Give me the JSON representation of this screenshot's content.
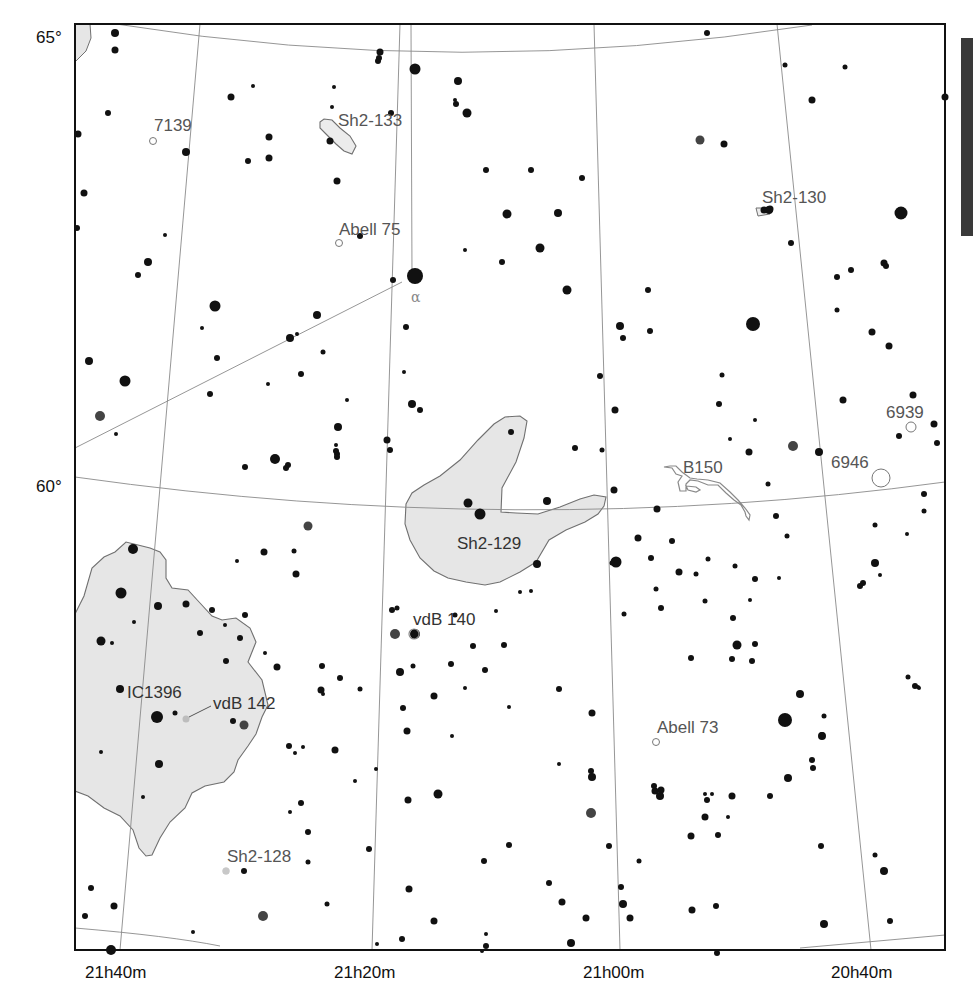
{
  "chart_data": {
    "type": "star_map",
    "title": "",
    "dec_labels": [
      {
        "text": "65°",
        "x": 38,
        "y": 30
      },
      {
        "text": "60°",
        "x": 38,
        "y": 492
      }
    ],
    "ra_labels": [
      {
        "text": "21h40m",
        "x": 118,
        "y": 978
      },
      {
        "text": "21h20m",
        "x": 372,
        "y": 978
      },
      {
        "text": "21h00m",
        "x": 622,
        "y": 978
      },
      {
        "text": "20h40m",
        "x": 867,
        "y": 978
      }
    ],
    "objects": [
      {
        "name": "7139",
        "type": "planetary-nebula",
        "label_x": 155,
        "label_y": 133,
        "mx": 153,
        "my": 141,
        "r": 3.5
      },
      {
        "name": "Sh2-133",
        "type": "emission-nebula",
        "label_x": 338,
        "label_y": 128
      },
      {
        "name": "Abell 75",
        "type": "planetary-nebula",
        "label_x": 340,
        "label_y": 235,
        "mx": 339,
        "my": 243,
        "r": 3.5
      },
      {
        "name": "Sh2-130",
        "type": "emission-nebula",
        "label_x": 762,
        "label_y": 203
      },
      {
        "name": "6939",
        "type": "open-cluster",
        "label_x": 887,
        "label_y": 418,
        "mx": 911,
        "my": 427,
        "r": 5
      },
      {
        "name": "6946",
        "type": "galaxy",
        "label_x": 831,
        "label_y": 468,
        "mx": 881,
        "my": 478,
        "r": 9
      },
      {
        "name": "B150",
        "type": "dark-nebula",
        "label_x": 683,
        "label_y": 473
      },
      {
        "name": "Sh2-129",
        "type": "emission-nebula",
        "label_x": 457,
        "label_y": 550
      },
      {
        "name": "vdB 140",
        "type": "reflection-nebula",
        "label_x": 414,
        "label_y": 625
      },
      {
        "name": "IC1396",
        "type": "emission-nebula",
        "label_x": 127,
        "label_y": 698
      },
      {
        "name": "vdB 142",
        "type": "reflection-nebula",
        "label_x": 213,
        "label_y": 710
      },
      {
        "name": "Abell 73",
        "type": "planetary-nebula",
        "label_x": 657,
        "label_y": 733,
        "mx": 656,
        "my": 742,
        "r": 3.5
      },
      {
        "name": "Sh2-128",
        "type": "emission-nebula",
        "label_x": 227,
        "label_y": 863,
        "mx": 226,
        "my": 871,
        "r": 3.5
      }
    ],
    "star_labels": [
      {
        "text": "α",
        "x": 411,
        "y": 302
      }
    ],
    "stars": [
      [
        115,
        33,
        4
      ],
      [
        115,
        50,
        3.5
      ],
      [
        108,
        113,
        3
      ],
      [
        78,
        134,
        3.5
      ],
      [
        84,
        193,
        3.5
      ],
      [
        77,
        228,
        3
      ],
      [
        186,
        152,
        4
      ],
      [
        148,
        262,
        4
      ],
      [
        215,
        306,
        5.5
      ],
      [
        125,
        381,
        5.5
      ],
      [
        100,
        416,
        5
      ],
      [
        89,
        361,
        4
      ],
      [
        116,
        434,
        2
      ],
      [
        165,
        235,
        2
      ],
      [
        138,
        275,
        3
      ],
      [
        202,
        328,
        2
      ],
      [
        217,
        358,
        3
      ],
      [
        231,
        97,
        3.5
      ],
      [
        253,
        86,
        2
      ],
      [
        269,
        137,
        3.5
      ],
      [
        248,
        161,
        3
      ],
      [
        269,
        158,
        3.5
      ],
      [
        210,
        394,
        3
      ],
      [
        380,
        52,
        3.5
      ],
      [
        379,
        58,
        3
      ],
      [
        378,
        61,
        3
      ],
      [
        334,
        87,
        2
      ],
      [
        332,
        107,
        2
      ],
      [
        391,
        113,
        3
      ],
      [
        330,
        141,
        3.5
      ],
      [
        337,
        181,
        3.5
      ],
      [
        360,
        236,
        3
      ],
      [
        415,
        69,
        5.5
      ],
      [
        458,
        81,
        4
      ],
      [
        455,
        100,
        2
      ],
      [
        456,
        104,
        3
      ],
      [
        467,
        113,
        4.5
      ],
      [
        415,
        276,
        8
      ],
      [
        393,
        280,
        3
      ],
      [
        486,
        170,
        3
      ],
      [
        531,
        170,
        3
      ],
      [
        582,
        178,
        3
      ],
      [
        507,
        214,
        4.5
      ],
      [
        558,
        213,
        4
      ],
      [
        540,
        248,
        4.5
      ],
      [
        465,
        250,
        2
      ],
      [
        502,
        262,
        3
      ],
      [
        567,
        290,
        4.5
      ],
      [
        620,
        326,
        4
      ],
      [
        648,
        290,
        3
      ],
      [
        650,
        331,
        3
      ],
      [
        707,
        33,
        3
      ],
      [
        785,
        65,
        2.5
      ],
      [
        812,
        100,
        3.5
      ],
      [
        700,
        140,
        4.5
      ],
      [
        724,
        144,
        3.5
      ],
      [
        845,
        67,
        2.5
      ],
      [
        791,
        243,
        3
      ],
      [
        753,
        324,
        7
      ],
      [
        769,
        210,
        4
      ],
      [
        945,
        97,
        3.5
      ],
      [
        901,
        213,
        6.5
      ],
      [
        884,
        263,
        3.5
      ],
      [
        886,
        266,
        3
      ],
      [
        851,
        270,
        3
      ],
      [
        837,
        277,
        3
      ],
      [
        837,
        310,
        2.5
      ],
      [
        872,
        332,
        3.5
      ],
      [
        793,
        446,
        5
      ],
      [
        819,
        452,
        4
      ],
      [
        843,
        400,
        3.5
      ],
      [
        913,
        395,
        3.5
      ],
      [
        889,
        346,
        3.5
      ],
      [
        899,
        436,
        3
      ],
      [
        937,
        443,
        3
      ],
      [
        934,
        424,
        3.5
      ],
      [
        924,
        494,
        3
      ],
      [
        924,
        511,
        2.5
      ],
      [
        907,
        534,
        2
      ],
      [
        875,
        563,
        4
      ],
      [
        863,
        583,
        3
      ],
      [
        880,
        575,
        2
      ],
      [
        317,
        315,
        4
      ],
      [
        297,
        334,
        2
      ],
      [
        290,
        338,
        4
      ],
      [
        268,
        384,
        2
      ],
      [
        323,
        352,
        2.5
      ],
      [
        347,
        400,
        2
      ],
      [
        301,
        374,
        3
      ],
      [
        288,
        465,
        3
      ],
      [
        245,
        467,
        3
      ],
      [
        275,
        459,
        5
      ],
      [
        286,
        468,
        3
      ],
      [
        406,
        327,
        3
      ],
      [
        412,
        404,
        4
      ],
      [
        387,
        440,
        3.5
      ],
      [
        390,
        450,
        3
      ],
      [
        404,
        372,
        2
      ],
      [
        338,
        427,
        4
      ],
      [
        336,
        451,
        3
      ],
      [
        337,
        454,
        3
      ],
      [
        337,
        457,
        3
      ],
      [
        336,
        445,
        2
      ],
      [
        468,
        503,
        4.5
      ],
      [
        480,
        514,
        5.5
      ],
      [
        547,
        501,
        4
      ],
      [
        537,
        564,
        4
      ],
      [
        511,
        432,
        3
      ],
      [
        420,
        410,
        3
      ],
      [
        575,
        448,
        3
      ],
      [
        623,
        338,
        3
      ],
      [
        600,
        376,
        3
      ],
      [
        615,
        410,
        3.5
      ],
      [
        602,
        450,
        2.5
      ],
      [
        614,
        490,
        3.5
      ],
      [
        616,
        562,
        5.5
      ],
      [
        657,
        509,
        3.5
      ],
      [
        719,
        404,
        3
      ],
      [
        722,
        375,
        2.5
      ],
      [
        768,
        484,
        2.5
      ],
      [
        776,
        516,
        3
      ],
      [
        787,
        536,
        2.5
      ],
      [
        749,
        452,
        3.5
      ],
      [
        730,
        439,
        2
      ],
      [
        755,
        420,
        2
      ],
      [
        679,
        572,
        3.5
      ],
      [
        656,
        589,
        2.5
      ],
      [
        705,
        601,
        2.5
      ],
      [
        733,
        618,
        3
      ],
      [
        750,
        600,
        2
      ],
      [
        779,
        578,
        2
      ],
      [
        691,
        658,
        3
      ],
      [
        732,
        659,
        3
      ],
      [
        737,
        645,
        4.5
      ],
      [
        755,
        644,
        3
      ],
      [
        752,
        661,
        3
      ],
      [
        785,
        720,
        7
      ],
      [
        822,
        736,
        4
      ],
      [
        824,
        716,
        2.5
      ],
      [
        822,
        735,
        3
      ],
      [
        812,
        760,
        3
      ],
      [
        800,
        694,
        4
      ],
      [
        788,
        778,
        4
      ],
      [
        821,
        846,
        3
      ],
      [
        884,
        871,
        4
      ],
      [
        875,
        855,
        2.5
      ],
      [
        824,
        924,
        4
      ],
      [
        890,
        921,
        3
      ],
      [
        915,
        686,
        3
      ],
      [
        918,
        687,
        2
      ],
      [
        908,
        677,
        2.5
      ],
      [
        919,
        688,
        2
      ],
      [
        860,
        586,
        3
      ],
      [
        875,
        525,
        2.5
      ],
      [
        133,
        549,
        5
      ],
      [
        121,
        593,
        5.5
      ],
      [
        134,
        622,
        2
      ],
      [
        101,
        641,
        4.5
      ],
      [
        112,
        643,
        2
      ],
      [
        158,
        606,
        4
      ],
      [
        186,
        604,
        3.5
      ],
      [
        212,
        610,
        3
      ],
      [
        240,
        638,
        3
      ],
      [
        245,
        615,
        3
      ],
      [
        264,
        552,
        3.5
      ],
      [
        237,
        561,
        2
      ],
      [
        294,
        551,
        2.5
      ],
      [
        296,
        574,
        3.5
      ],
      [
        308,
        526,
        4.5
      ],
      [
        225,
        625,
        2
      ],
      [
        200,
        633,
        3
      ],
      [
        226,
        661,
        3
      ],
      [
        120,
        689,
        4
      ],
      [
        157,
        717,
        6
      ],
      [
        175,
        713,
        2.5
      ],
      [
        233,
        721,
        3
      ],
      [
        244,
        725,
        4.5
      ],
      [
        101,
        752,
        2
      ],
      [
        159,
        764,
        4
      ],
      [
        143,
        797,
        2
      ],
      [
        265,
        653,
        2
      ],
      [
        277,
        667,
        3.5
      ],
      [
        289,
        746,
        3
      ],
      [
        303,
        747,
        2
      ],
      [
        322,
        666,
        3
      ],
      [
        340,
        678,
        3
      ],
      [
        290,
        812,
        2
      ],
      [
        295,
        753,
        2
      ],
      [
        244,
        871,
        3
      ],
      [
        263,
        916,
        5
      ],
      [
        91,
        888,
        3
      ],
      [
        114,
        906,
        3.5
      ],
      [
        85,
        916,
        3
      ],
      [
        193,
        932,
        2
      ],
      [
        321,
        690,
        3.5
      ],
      [
        323,
        694,
        2
      ],
      [
        111,
        950,
        5
      ],
      [
        395,
        634,
        5
      ],
      [
        415,
        634,
        5
      ],
      [
        392,
        610,
        3
      ],
      [
        397,
        608,
        2.5
      ],
      [
        455,
        615,
        2.5
      ],
      [
        496,
        611,
        2
      ],
      [
        400,
        672,
        4
      ],
      [
        413,
        666,
        2.5
      ],
      [
        451,
        664,
        3
      ],
      [
        473,
        646,
        3
      ],
      [
        465,
        688,
        2
      ],
      [
        509,
        707,
        2
      ],
      [
        452,
        736,
        2
      ],
      [
        434,
        696,
        3.5
      ],
      [
        360,
        689,
        2.5
      ],
      [
        376,
        769,
        2
      ],
      [
        355,
        781,
        2
      ],
      [
        335,
        750,
        3.5
      ],
      [
        301,
        803,
        3
      ],
      [
        308,
        832,
        3
      ],
      [
        308,
        862,
        2.5
      ],
      [
        327,
        904,
        2.5
      ],
      [
        403,
        708,
        3
      ],
      [
        407,
        731,
        3.5
      ],
      [
        438,
        794,
        4.5
      ],
      [
        408,
        800,
        3.5
      ],
      [
        369,
        849,
        3
      ],
      [
        409,
        889,
        3.5
      ],
      [
        402,
        939,
        3
      ],
      [
        377,
        944,
        2
      ],
      [
        434,
        921,
        3.5
      ],
      [
        484,
        861,
        3
      ],
      [
        485,
        670,
        3
      ],
      [
        504,
        645,
        3
      ],
      [
        520,
        592,
        2
      ],
      [
        531,
        591,
        2
      ],
      [
        559,
        689,
        3
      ],
      [
        591,
        771,
        3
      ],
      [
        592,
        713,
        3.5
      ],
      [
        592,
        777,
        4
      ],
      [
        591,
        813,
        5
      ],
      [
        562,
        902,
        3.5
      ],
      [
        586,
        918,
        3.5
      ],
      [
        571,
        943,
        4
      ],
      [
        549,
        883,
        3
      ],
      [
        509,
        845,
        3
      ],
      [
        486,
        934,
        2
      ],
      [
        482,
        951,
        2
      ],
      [
        486,
        946,
        3
      ],
      [
        559,
        764,
        2
      ],
      [
        609,
        846,
        3
      ],
      [
        621,
        887,
        3
      ],
      [
        623,
        904,
        4
      ],
      [
        630,
        918,
        3.5
      ],
      [
        639,
        861,
        2.5
      ],
      [
        661,
        790,
        3.5
      ],
      [
        655,
        791,
        3.5
      ],
      [
        705,
        794,
        2
      ],
      [
        712,
        794,
        2
      ],
      [
        732,
        796,
        3.5
      ],
      [
        705,
        817,
        3.5
      ],
      [
        691,
        836,
        3.5
      ],
      [
        718,
        835,
        3
      ],
      [
        728,
        817,
        2
      ],
      [
        692,
        910,
        3.5
      ],
      [
        716,
        906,
        3
      ],
      [
        717,
        953,
        3
      ],
      [
        660,
        796,
        4
      ],
      [
        654,
        786,
        3
      ],
      [
        707,
        800,
        3
      ],
      [
        612,
        563,
        2.5
      ],
      [
        624,
        614,
        2.5
      ],
      [
        661,
        608,
        3
      ],
      [
        638,
        538,
        3.5
      ],
      [
        651,
        558,
        3
      ],
      [
        672,
        541,
        3
      ],
      [
        755,
        579,
        3
      ],
      [
        696,
        574,
        2.5
      ],
      [
        735,
        566,
        2.5
      ],
      [
        708,
        559,
        2.5
      ],
      [
        813,
        768,
        3
      ],
      [
        770,
        796,
        3
      ]
    ]
  },
  "nebulae": [
    {
      "name": "IC1396",
      "fill": "#e6e6e6"
    },
    {
      "name": "Sh2-129",
      "fill": "#e6e6e6"
    },
    {
      "name": "Sh2-133",
      "fill": "#e9e9e9"
    }
  ],
  "colors": {
    "grid": "#888888",
    "frame": "#111111",
    "star": "#111111",
    "nebula_fill": "#e6e6e6",
    "nebula_stroke": "#707070",
    "label": "#555555"
  }
}
